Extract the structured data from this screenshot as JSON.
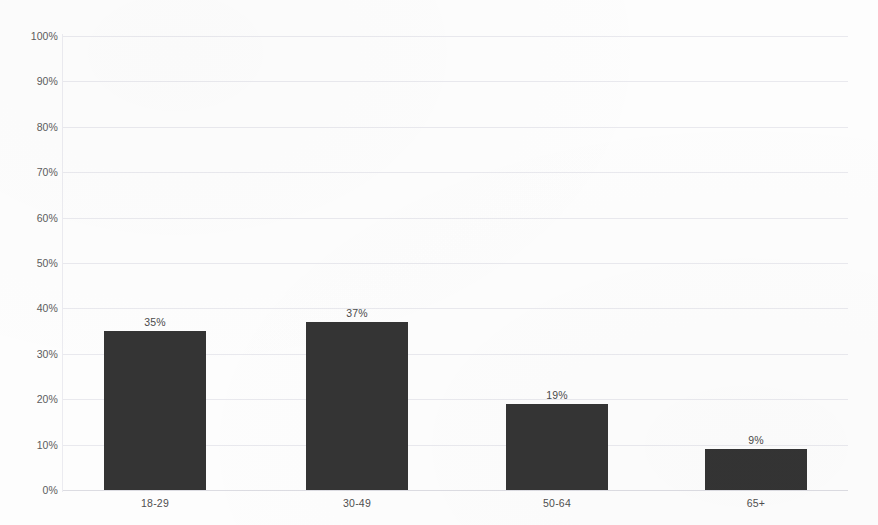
{
  "chart_data": {
    "type": "bar",
    "title": "",
    "subtitle": "",
    "xlabel": "",
    "ylabel": "",
    "categories": [
      "18-29",
      "30-49",
      "50-64",
      "65+"
    ],
    "values": [
      35,
      37,
      19,
      9
    ],
    "value_labels": [
      "35%",
      "37%",
      "19%",
      "9%"
    ],
    "series": [
      {
        "name": "",
        "values": [
          35,
          37,
          19,
          9
        ]
      }
    ],
    "ylim": [
      0,
      100
    ],
    "y_ticks": [
      0,
      10,
      20,
      30,
      40,
      50,
      60,
      70,
      80,
      90,
      100
    ],
    "y_tick_labels": [
      "0%",
      "10%",
      "20%",
      "30%",
      "40%",
      "50%",
      "60%",
      "70%",
      "80%",
      "90%",
      "100%"
    ],
    "grid": true,
    "grid_axis": "y",
    "legend": false,
    "legend_position": "none",
    "bar_color": "#343434",
    "grid_color": "#e9e9ee",
    "axis_text_color": "#5c5c5c",
    "background_color": "#fdfdfd"
  }
}
